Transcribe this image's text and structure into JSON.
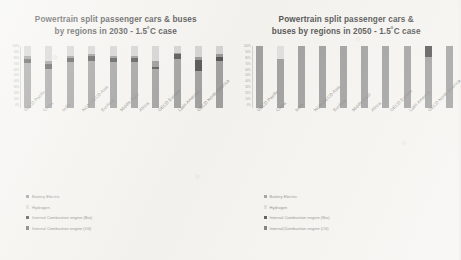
{
  "slide": {
    "background_color": "#f3f2ee"
  },
  "charts": [
    {
      "id": "chart-2030",
      "title_line1": "Powertrain split passenger cars & buses",
      "title_line2": "by regions in 2030 - 1.5˚C case"
    },
    {
      "id": "chart-2050",
      "title_line1": "Powertrain split passenger cars &",
      "title_line2": "buses by regions in 2050 - 1.5˚C case"
    }
  ],
  "legend": [
    {
      "label": "Battery Electric",
      "color": "#8a8a8a"
    },
    {
      "label": "Hydrogen",
      "color": "#d6d6d6"
    },
    {
      "label": "Internal Combustion engine (Bio)",
      "color": "#2e2e2e"
    },
    {
      "label": "Internal Combustion engine (Oil)",
      "color": "#5a5a5a"
    }
  ],
  "y_ticks": [
    "100%",
    "90%",
    "80%",
    "70%",
    "60%",
    "50%",
    "40%",
    "30%",
    "20%",
    "10%",
    "0%"
  ],
  "chart_data": [
    {
      "type": "bar",
      "stacked": "100%",
      "title": "Powertrain split passenger cars & buses by regions in 2030 - 1.5˚C case",
      "xlabel": "",
      "ylabel": "",
      "ylim": [
        0,
        100
      ],
      "grid": false,
      "legend_position": "bottom-left",
      "categories": [
        "OECD Pacific",
        "China",
        "India",
        "NON-OECD Asia",
        "EurAsia",
        "Middle East",
        "Africa",
        "OECD Europe",
        "Latin America",
        "OECD North America"
      ],
      "series": [
        {
          "name": "Battery Electric",
          "color": "#8a8a8a",
          "values": [
            72,
            62,
            74,
            76,
            74,
            74,
            62,
            79,
            60,
            75
          ]
        },
        {
          "name": "Internal Combustion engine (Oil)",
          "color": "#2e2e2e",
          "values": [
            7,
            9,
            6,
            7,
            6,
            6,
            4,
            7,
            17,
            7
          ]
        },
        {
          "name": "Internal Combustion engine (Bio)",
          "color": "#7e7e7e",
          "values": [
            4,
            5,
            4,
            3,
            4,
            4,
            10,
            3,
            5,
            4
          ]
        },
        {
          "name": "Hydrogen",
          "color": "#c9c9c9",
          "values": [
            17,
            24,
            16,
            14,
            16,
            16,
            24,
            11,
            18,
            14
          ]
        }
      ]
    },
    {
      "type": "bar",
      "stacked": "100%",
      "title": "Powertrain split passenger cars & buses by regions in 2050 - 1.5˚C case",
      "xlabel": "",
      "ylabel": "",
      "ylim": [
        0,
        100
      ],
      "grid": false,
      "legend_position": "bottom-left",
      "categories": [
        "OECD Pacific",
        "China",
        "India",
        "NON-OECD Asia",
        "EurAsia",
        "Middle East",
        "Africa",
        "OECD Europe",
        "Latin America",
        "OECD North America"
      ],
      "series": [
        {
          "name": "Battery Electric",
          "color": "#8a8a8a",
          "values": [
            100,
            78,
            100,
            100,
            100,
            100,
            100,
            100,
            82,
            100
          ]
        },
        {
          "name": "Internal Combustion engine (Oil)",
          "color": "#2e2e2e",
          "values": [
            0,
            0,
            0,
            0,
            0,
            0,
            0,
            0,
            18,
            0
          ]
        },
        {
          "name": "Internal Combustion engine (Bio)",
          "color": "#7e7e7e",
          "values": [
            0,
            0,
            0,
            0,
            0,
            0,
            0,
            0,
            0,
            0
          ]
        },
        {
          "name": "Hydrogen",
          "color": "#d9d9d9",
          "values": [
            0,
            22,
            0,
            0,
            0,
            0,
            0,
            0,
            0,
            0
          ]
        }
      ]
    }
  ]
}
